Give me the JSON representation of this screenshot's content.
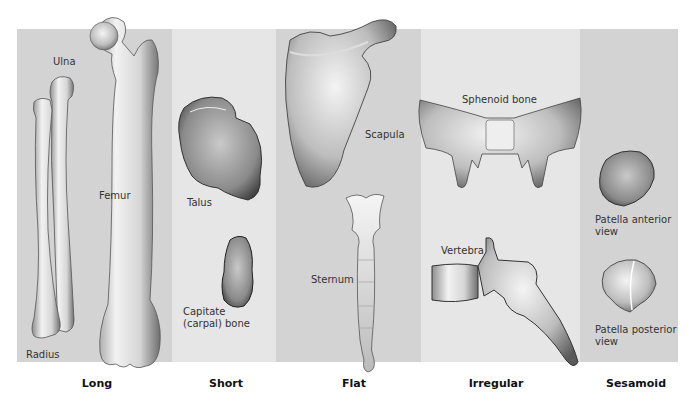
{
  "figure": {
    "categories": [
      {
        "id": "long",
        "label": "Long",
        "bones": [
          "Ulna",
          "Radius",
          "Femur"
        ]
      },
      {
        "id": "short",
        "label": "Short",
        "bones": [
          "Talus",
          "Capitate (carpal) bone"
        ]
      },
      {
        "id": "flat",
        "label": "Flat",
        "bones": [
          "Scapula",
          "Sternum"
        ]
      },
      {
        "id": "irregular",
        "label": "Irregular",
        "bones": [
          "Sphenoid bone",
          "Vertebra"
        ]
      },
      {
        "id": "sesamoid",
        "label": "Sesamoid",
        "bones": [
          "Patella anterior view",
          "Patella posterior view"
        ]
      }
    ],
    "labels": {
      "ulna": "Ulna",
      "radius": "Radius",
      "femur": "Femur",
      "talus": "Talus",
      "capitate_line1": "Capitate",
      "capitate_line2": "(carpal) bone",
      "scapula": "Scapula",
      "sternum": "Sternum",
      "sphenoid": "Sphenoid bone",
      "vertebra": "Vertebra",
      "patella_ant_line1": "Patella anterior",
      "patella_ant_line2": "view",
      "patella_post_line1": "Patella posterior",
      "patella_post_line2": "view"
    },
    "colors": {
      "panel_dark": "#d3d3d3",
      "panel_light": "#e6e6e6",
      "bone_fill": "#ebebeb",
      "bone_shade": "#9a9a9a",
      "bone_outline": "#4a4a4a"
    }
  }
}
